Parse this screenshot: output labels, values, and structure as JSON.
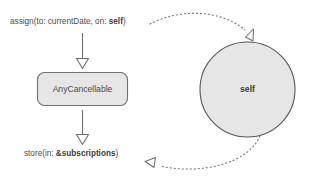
{
  "diagram": {
    "type": "flow-diagram",
    "background_color": "#ffffff",
    "stroke_color": "#6f6f6f",
    "node_fill_color": "#e6e6e6",
    "text_color": "#4a4a4a",
    "labels": {
      "assign_prefix": "assign(to: currentDate, on: ",
      "assign_bold": "self",
      "assign_suffix": ")",
      "store_prefix": "store(in: ",
      "store_bold": "&subscriptions",
      "store_suffix": ")"
    },
    "nodes": {
      "box": {
        "label": "AnyCancellable",
        "shape": "rounded-rectangle"
      },
      "circle": {
        "label": "self",
        "shape": "circle"
      }
    },
    "edges": [
      {
        "name": "assign-to-box",
        "style": "solid",
        "arrowhead": "open-triangle"
      },
      {
        "name": "box-to-store",
        "style": "solid",
        "arrowhead": "open-triangle"
      },
      {
        "name": "assign-to-self",
        "style": "dotted",
        "arrowhead": "open-triangle"
      },
      {
        "name": "self-to-store",
        "style": "dotted",
        "arrowhead": "open-triangle"
      }
    ]
  }
}
